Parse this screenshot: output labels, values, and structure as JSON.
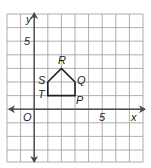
{
  "figure": {
    "type": "coordinate-plane",
    "grid": {
      "x_min": -2,
      "x_max": 8,
      "y_min": -4,
      "y_max": 7,
      "cell_px": 13.6
    },
    "colors": {
      "grid": "#8c8c8c",
      "axis": "#4a4a4a",
      "polygon": "#231f20",
      "text": "#231f20"
    },
    "axes": {
      "x_label": "x",
      "y_label": "y",
      "origin_label": "O",
      "x_tick_label": "5",
      "y_tick_label": "5"
    },
    "polygon": {
      "name": "PQRST",
      "vertices": [
        {
          "label": "P",
          "x": 3,
          "y": 1
        },
        {
          "label": "Q",
          "x": 3,
          "y": 2
        },
        {
          "label": "R",
          "x": 2,
          "y": 3
        },
        {
          "label": "S",
          "x": 1,
          "y": 2
        },
        {
          "label": "T",
          "x": 1,
          "y": 1
        }
      ]
    }
  }
}
